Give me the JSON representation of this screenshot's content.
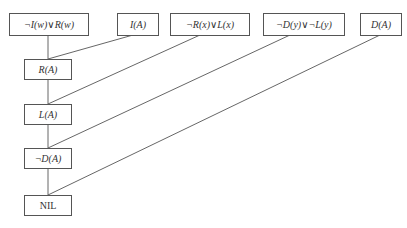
{
  "diagram": {
    "type": "resolution-refutation-tree",
    "premises": [
      {
        "id": "p1",
        "label": "¬I(w)∨R(w)"
      },
      {
        "id": "p2",
        "label": "I(A)"
      },
      {
        "id": "p3",
        "label": "¬R(x)∨L(x)"
      },
      {
        "id": "p4",
        "label": "¬D(y)∨¬L(y)"
      },
      {
        "id": "p5",
        "label": "D(A)"
      }
    ],
    "resolvents": [
      {
        "id": "r1",
        "label": "R(A)"
      },
      {
        "id": "r2",
        "label": "L(A)"
      },
      {
        "id": "r3",
        "label": "¬D(A)"
      },
      {
        "id": "r4",
        "label": "NIL"
      }
    ],
    "edges": [
      {
        "from": "p1",
        "to": "r1"
      },
      {
        "from": "p2",
        "to": "r1"
      },
      {
        "from": "r1",
        "to": "r2"
      },
      {
        "from": "p3",
        "to": "r2"
      },
      {
        "from": "r2",
        "to": "r3"
      },
      {
        "from": "p4",
        "to": "r3"
      },
      {
        "from": "r3",
        "to": "r4"
      },
      {
        "from": "p5",
        "to": "r4"
      }
    ]
  },
  "colors": {
    "line": "#555555",
    "border": "#555555",
    "text": "#333333",
    "background": "#ffffff"
  }
}
